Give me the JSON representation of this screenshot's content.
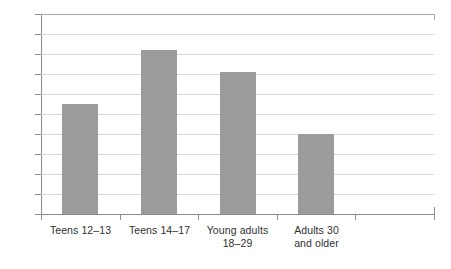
{
  "chart_data": {
    "type": "bar",
    "title": "",
    "subtitle": "",
    "xlabel": "",
    "ylabel": "",
    "categories": [
      "Teens 12–13",
      "Teens 14–17",
      "Young adults 18–29",
      "Adults 30 and older"
    ],
    "category_lines": [
      [
        "Teens 12–13"
      ],
      [
        "Teens 14–17"
      ],
      [
        "Young adults",
        "18–29"
      ],
      [
        "Adults 30",
        "and older"
      ]
    ],
    "values": [
      55,
      82,
      71,
      40
    ],
    "ylim": [
      0,
      100
    ],
    "ytick_step": 10,
    "ytick_labels": [
      "0",
      "10",
      "20",
      "30",
      "40",
      "50",
      "60",
      "70",
      "80",
      "90",
      "100"
    ],
    "grid": true,
    "legend": false,
    "bar_color": "#9b9b9b",
    "gridline_color": "#d9d9d9",
    "axis_color": "#8c8c8c",
    "background_color": "#ffffff",
    "text_color": "#3b3b3b"
  }
}
